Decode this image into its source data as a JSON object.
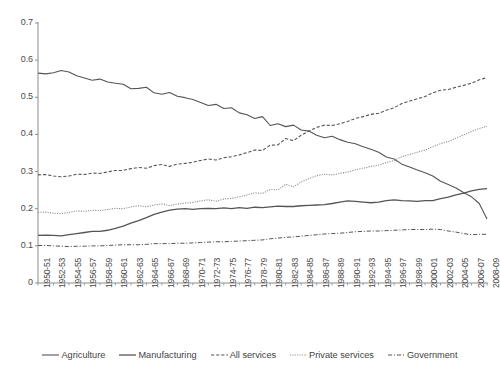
{
  "chart_data": {
    "type": "line",
    "title": "",
    "xlabel": "",
    "ylabel": "",
    "ylim": [
      0,
      0.7
    ],
    "ytick_values": [
      0,
      0.1,
      0.2,
      0.3,
      0.4,
      0.5,
      0.6,
      0.7
    ],
    "ytick_labels": [
      "0",
      "0.1",
      "0.2",
      "0.3",
      "0.4",
      "0.5",
      "0.6",
      "0.7"
    ],
    "grid": false,
    "legend_position": "bottom",
    "x": [
      "1950-51",
      "1951-52",
      "1952-53",
      "1953-54",
      "1954-55",
      "1955-56",
      "1956-57",
      "1957-58",
      "1958-59",
      "1959-60",
      "1960-61",
      "1961-62",
      "1962-63",
      "1963-64",
      "1964-65",
      "1965-66",
      "1966-67",
      "1967-68",
      "1968-69",
      "1969-70",
      "1970-71",
      "1971-72",
      "1972-73",
      "1973-74",
      "1974-75",
      "1975-76",
      "1976-77",
      "1977-78",
      "1978-79",
      "1979-80",
      "1980-81",
      "1981-82",
      "1982-83",
      "1983-84",
      "1984-85",
      "1985-86",
      "1986-87",
      "1987-88",
      "1988-89",
      "1989-90",
      "1990-91",
      "1991-92",
      "1992-93",
      "1993-94",
      "1994-95",
      "1995-96",
      "1996-97",
      "1997-98",
      "1998-99",
      "1999-2000",
      "2000-01",
      "2001-02",
      "2002-03",
      "2003-04",
      "2004-05",
      "2005-06",
      "2006-07",
      "2007-08",
      "2008-09"
    ],
    "xtick_labels": [
      "1950-51",
      "1952-53",
      "1954-55",
      "1956-57",
      "1958-59",
      "1960-61",
      "1962-63",
      "1964-65",
      "1966-67",
      "1968-69",
      "1970-71",
      "1972-73",
      "1974-75",
      "1976-77",
      "1978-79",
      "1980-81",
      "1982-83",
      "1984-85",
      "1986-87",
      "1988-89",
      "1990-91",
      "1992-93",
      "1994-95",
      "1996-97",
      "1998-99",
      "2000-01",
      "2002-03",
      "2004-05",
      "2006-07",
      "2008-09"
    ],
    "xtick_indices": [
      0,
      2,
      4,
      6,
      8,
      10,
      12,
      14,
      16,
      18,
      20,
      22,
      24,
      26,
      28,
      30,
      32,
      34,
      36,
      38,
      40,
      42,
      44,
      46,
      48,
      50,
      52,
      54,
      56,
      58
    ],
    "series": [
      {
        "name": "Agriculture",
        "style": "solid",
        "color": "#555555",
        "width": 1.1,
        "values": [
          0.565,
          0.563,
          0.566,
          0.572,
          0.568,
          0.558,
          0.552,
          0.546,
          0.549,
          0.541,
          0.538,
          0.535,
          0.523,
          0.524,
          0.527,
          0.512,
          0.508,
          0.513,
          0.503,
          0.499,
          0.494,
          0.486,
          0.478,
          0.481,
          0.47,
          0.472,
          0.458,
          0.453,
          0.443,
          0.448,
          0.424,
          0.429,
          0.421,
          0.425,
          0.412,
          0.409,
          0.398,
          0.391,
          0.395,
          0.386,
          0.379,
          0.375,
          0.367,
          0.36,
          0.352,
          0.339,
          0.334,
          0.32,
          0.312,
          0.304,
          0.297,
          0.288,
          0.274,
          0.265,
          0.256,
          0.243,
          0.232,
          0.214,
          0.172
        ]
      },
      {
        "name": "Manufacturing",
        "style": "solid",
        "color": "#555555",
        "width": 1.3,
        "values": [
          0.128,
          0.129,
          0.128,
          0.127,
          0.13,
          0.133,
          0.136,
          0.139,
          0.139,
          0.142,
          0.147,
          0.153,
          0.161,
          0.168,
          0.176,
          0.185,
          0.191,
          0.196,
          0.199,
          0.2,
          0.198,
          0.2,
          0.201,
          0.2,
          0.202,
          0.2,
          0.203,
          0.201,
          0.204,
          0.203,
          0.205,
          0.207,
          0.206,
          0.206,
          0.208,
          0.209,
          0.21,
          0.211,
          0.214,
          0.218,
          0.221,
          0.22,
          0.218,
          0.216,
          0.218,
          0.222,
          0.224,
          0.222,
          0.221,
          0.22,
          0.222,
          0.222,
          0.227,
          0.231,
          0.237,
          0.242,
          0.248,
          0.252,
          0.254
        ]
      },
      {
        "name": "All services",
        "style": "dashed",
        "color": "#555555",
        "width": 1.1,
        "values": [
          0.291,
          0.292,
          0.288,
          0.286,
          0.288,
          0.293,
          0.292,
          0.296,
          0.295,
          0.299,
          0.303,
          0.303,
          0.308,
          0.311,
          0.309,
          0.316,
          0.319,
          0.314,
          0.32,
          0.322,
          0.325,
          0.33,
          0.334,
          0.331,
          0.337,
          0.34,
          0.345,
          0.351,
          0.358,
          0.357,
          0.371,
          0.372,
          0.389,
          0.383,
          0.398,
          0.409,
          0.419,
          0.425,
          0.424,
          0.429,
          0.435,
          0.443,
          0.448,
          0.454,
          0.457,
          0.465,
          0.472,
          0.483,
          0.49,
          0.496,
          0.502,
          0.512,
          0.519,
          0.521,
          0.527,
          0.532,
          0.538,
          0.547,
          0.553
        ]
      },
      {
        "name": "Private services",
        "style": "dotted",
        "color": "#8a8a8a",
        "width": 1.1,
        "values": [
          0.19,
          0.191,
          0.188,
          0.187,
          0.19,
          0.194,
          0.193,
          0.196,
          0.195,
          0.198,
          0.201,
          0.2,
          0.205,
          0.208,
          0.205,
          0.21,
          0.213,
          0.208,
          0.213,
          0.215,
          0.217,
          0.221,
          0.224,
          0.22,
          0.226,
          0.228,
          0.232,
          0.237,
          0.243,
          0.241,
          0.252,
          0.251,
          0.266,
          0.259,
          0.272,
          0.281,
          0.289,
          0.293,
          0.291,
          0.295,
          0.299,
          0.305,
          0.309,
          0.314,
          0.317,
          0.324,
          0.33,
          0.34,
          0.346,
          0.352,
          0.358,
          0.367,
          0.375,
          0.381,
          0.39,
          0.399,
          0.408,
          0.416,
          0.422
        ]
      },
      {
        "name": "Government",
        "style": "dashdot",
        "color": "#555555",
        "width": 1.0,
        "values": [
          0.101,
          0.101,
          0.1,
          0.099,
          0.098,
          0.099,
          0.099,
          0.1,
          0.1,
          0.101,
          0.102,
          0.103,
          0.103,
          0.103,
          0.104,
          0.106,
          0.106,
          0.106,
          0.107,
          0.107,
          0.108,
          0.109,
          0.11,
          0.111,
          0.111,
          0.112,
          0.113,
          0.114,
          0.115,
          0.116,
          0.119,
          0.121,
          0.123,
          0.124,
          0.126,
          0.128,
          0.13,
          0.132,
          0.133,
          0.134,
          0.136,
          0.138,
          0.139,
          0.14,
          0.14,
          0.141,
          0.142,
          0.143,
          0.144,
          0.144,
          0.144,
          0.145,
          0.144,
          0.14,
          0.137,
          0.133,
          0.13,
          0.131,
          0.131
        ]
      }
    ]
  },
  "legend": {
    "items": [
      {
        "label": "Agriculture",
        "style": "solid"
      },
      {
        "label": "Manufacturing",
        "style": "solid"
      },
      {
        "label": "All services",
        "style": "dashed"
      },
      {
        "label": "Private services",
        "style": "dotted"
      },
      {
        "label": "Government",
        "style": "dashdot"
      }
    ]
  },
  "axes": {
    "axis_color": "#8c8c8c"
  }
}
